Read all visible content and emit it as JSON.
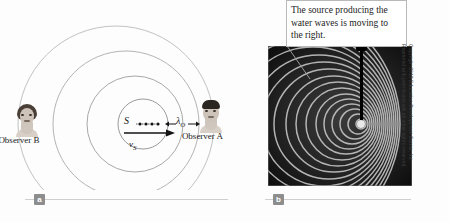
{
  "figure": {
    "type": "doppler-effect-water-waves",
    "panels": [
      {
        "id": "a",
        "badge_label": "a",
        "kind": "diagram"
      },
      {
        "id": "b",
        "badge_label": "b",
        "kind": "photograph"
      }
    ]
  },
  "panel_a": {
    "observer_b_label": "Observer B",
    "observer_a_label": "Observer A",
    "source_label": "S",
    "source_velocity_label": "v",
    "source_velocity_sub": "S",
    "wavelength_label": "λ",
    "wavelength_sub": "O",
    "wavefront_count": 4,
    "wave_color": "#b4b4b4"
  },
  "panel_b": {
    "caption": "The source producing the water waves is moving to the right.",
    "photo_description": "ripple-tank photograph of circular water waves compressed on the right side",
    "background_color": "#0b0b0b"
  },
  "credit": {
    "text": "Copyright 2013 Education Development Center, Inc. Reprinted with permission will all other rights reserved."
  }
}
